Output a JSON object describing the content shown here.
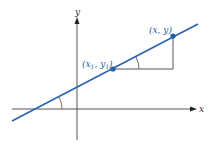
{
  "diagram": {
    "axes": {
      "x_label": "x",
      "y_label": "y",
      "axis_color": "#444444"
    },
    "line": {
      "color": "#2a64b0"
    },
    "points": [
      {
        "label_main": "(x",
        "label_sub1": "1",
        "label_mid": ", y",
        "label_sub2": "1",
        "label_end": ")"
      },
      {
        "label": "(x, y)"
      }
    ],
    "point_color": "#1f5fae",
    "label_color": "#2a5a9a",
    "angle_arc_color": "#7a4030",
    "triangle_color": "#444444"
  }
}
